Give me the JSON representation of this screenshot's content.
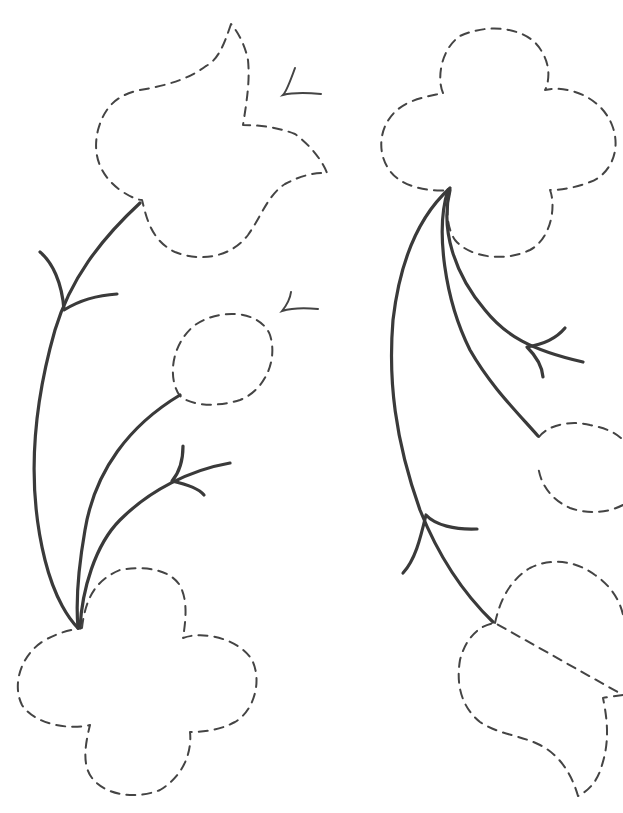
{
  "diagram": {
    "title": "",
    "background": "#ffffff",
    "stroke_color": "#3a3a3a",
    "shapes": [
      {
        "id": "tulip-top-left",
        "type": "dashed-outline",
        "kind": "tulip-leaf",
        "d": "M231,24 C224,45 218,60 206,66 C190,78 170,85 140,90 C118,95 105,105 98,130 C92,155 100,175 120,190 C130,197 138,200 142,200 C146,215 150,240 175,252 C200,262 230,258 248,235 C262,215 268,195 285,184 C300,176 315,172 327,173 C322,160 310,145 295,134 C280,128 262,125 243,125 C247,100 250,80 248,60 C245,45 238,32 231,24 Z"
      },
      {
        "id": "flower-top-right",
        "type": "dashed-outline",
        "kind": "four-petal-flower",
        "d": "M443,93 C437,80 440,50 460,36 C490,22 530,28 542,52 C552,68 548,85 545,90 C565,85 600,95 612,125 C622,150 610,175 590,182 C575,188 560,190 550,190 C556,205 552,238 530,250 C505,262 470,258 455,240 C445,225 447,205 450,190 C430,192 400,188 388,168 C375,148 380,115 410,102 C422,97 435,95 443,93 Z"
      },
      {
        "id": "bud-middle-left",
        "type": "dashed-outline",
        "kind": "oval-bud",
        "d": "M180,396 C168,380 170,345 195,325 C220,308 260,310 270,335 C278,360 265,390 240,400 C215,408 190,405 180,396 Z"
      },
      {
        "id": "bud-middle-right",
        "type": "dashed-outline",
        "kind": "oval-bud-partial",
        "d": "M539,437 C548,425 570,420 590,425 C605,428 615,432 623,440 M623,505 C610,512 590,515 570,508 C552,500 540,485 538,465"
      },
      {
        "id": "flower-bottom-left",
        "type": "dashed-outline",
        "kind": "four-petal-flower",
        "d": "M82,628 C85,600 95,580 120,570 C145,565 175,570 182,590 C188,605 185,625 183,638 C205,630 240,640 252,660 C262,680 255,710 235,722 C220,730 205,732 190,732 C192,750 185,775 160,790 C135,800 105,795 92,778 C82,765 85,745 90,725 C70,730 35,725 22,705 C12,685 20,655 45,640 C60,632 70,630 82,628 Z"
      },
      {
        "id": "tulip-bottom-right",
        "type": "dashed-outline",
        "kind": "tulip-leaf-partial",
        "d": "M495,623 C500,600 510,580 530,568 C550,558 575,560 595,575 C610,585 620,600 623,615 M623,695 C615,696 608,697 603,698 C607,718 610,740 602,765 C598,780 590,790 578,796 C572,775 560,755 540,745 C520,735 500,735 480,722 C465,710 455,690 460,660 C465,640 478,625 495,623 Z"
      }
    ],
    "stems": [
      {
        "id": "stem-left-long",
        "d": "M140,203 C100,240 70,280 55,330 C35,400 25,480 45,560 C55,600 70,620 78,628"
      },
      {
        "id": "stem-left-to-bud",
        "d": "M180,395 C130,425 95,470 85,530 C78,570 76,605 78,628"
      },
      {
        "id": "stem-left-branch",
        "d": "M230,463 C190,470 150,490 120,520 C95,545 82,590 80,628"
      },
      {
        "id": "stem-right-long",
        "d": "M450,188 C420,215 400,260 393,320 C388,380 395,440 420,510 C440,560 465,595 493,622"
      },
      {
        "id": "stem-right-to-bud",
        "d": "M448,190 C435,230 445,300 470,350 C490,385 515,410 538,436"
      },
      {
        "id": "stem-right-branch",
        "d": "M450,190 C440,230 455,275 485,310 C505,335 530,350 583,362"
      }
    ],
    "arrow_marks": [
      {
        "id": "mark-left-upper",
        "d": "M40,252 C52,262 62,282 64,310 C80,300 100,295 117,294"
      },
      {
        "id": "mark-left-middle",
        "d": "M183,446 C183,462 178,474 172,481 C190,485 200,490 204,495"
      },
      {
        "id": "mark-right-upper",
        "d": "M565,328 C555,340 540,345 527,347 C535,355 542,365 543,377"
      },
      {
        "id": "mark-right-lower",
        "d": "M403,573 C415,560 420,540 426,515 C435,525 455,530 477,529"
      }
    ],
    "thin_marks": [
      {
        "id": "tick-top-right",
        "d": "M295,68 C290,82 286,92 283,95 C295,92 310,93 321,94"
      },
      {
        "id": "tick-middle-right",
        "d": "M291,292 C290,300 286,306 282,311 C295,307 308,308 318,309"
      }
    ],
    "labels": []
  }
}
